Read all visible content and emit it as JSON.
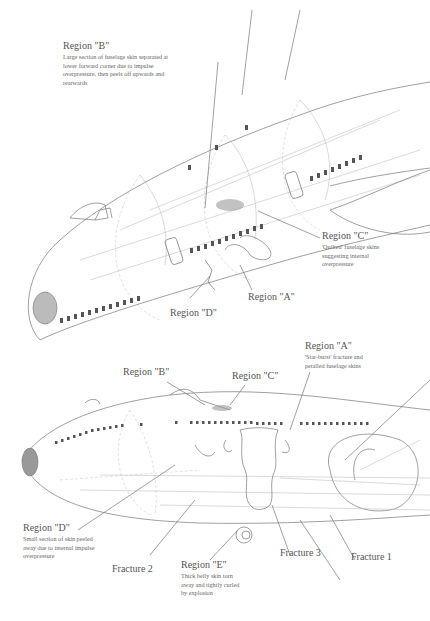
{
  "figure": {
    "upper_view": {
      "callouts": [
        {
          "id": "B",
          "label": "Region \"B\"",
          "description": [
            "Large section of fuselage skin separated at",
            "lower forward corner due to impulse",
            "overpressure, then peels off upwards and",
            "rearwards"
          ]
        },
        {
          "id": "C",
          "label": "Region \"C\"",
          "description": [
            "'Quilted' fuselage skins",
            "suggesting internal",
            "overpressure"
          ]
        },
        {
          "id": "A",
          "label": "Region \"A\"",
          "description": []
        },
        {
          "id": "D",
          "label": "Region \"D\"",
          "description": []
        }
      ]
    },
    "lower_view": {
      "callouts": [
        {
          "id": "A",
          "label": "Region \"A\"",
          "description": [
            "'Star-burst' fracture and",
            "petalled fuselage skins"
          ]
        },
        {
          "id": "B",
          "label": "Region \"B\"",
          "description": []
        },
        {
          "id": "C",
          "label": "Region \"C\"",
          "description": []
        },
        {
          "id": "D",
          "label": "Region \"D\"",
          "description": [
            "Small section of skin peeled",
            "away  due to internal impulse",
            "overpressure"
          ]
        },
        {
          "id": "E",
          "label": "Region \"E\"",
          "description": [
            "Thick belly skin torn",
            "away and tightly curled",
            "by explosion"
          ]
        }
      ],
      "fractures": [
        "Fracture 2",
        "Fracture 3",
        "Fracture 1"
      ]
    }
  }
}
